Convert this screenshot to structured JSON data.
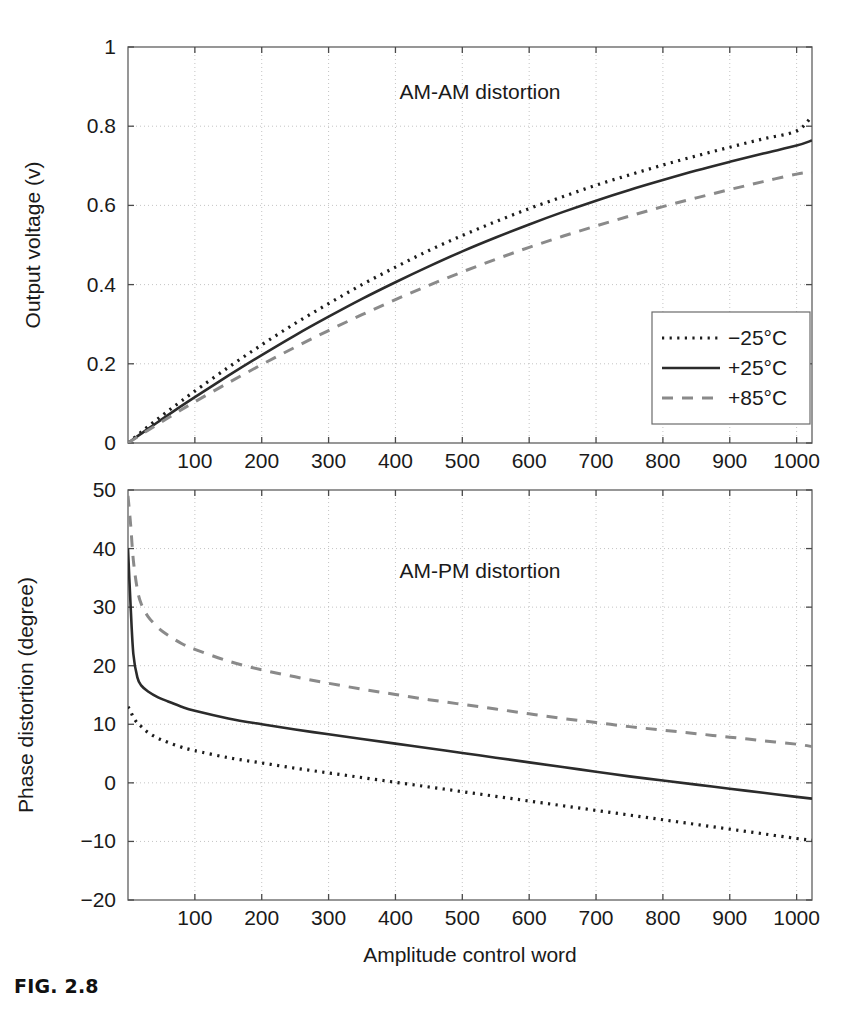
{
  "figure": {
    "caption": "FIG. 2.8"
  },
  "chart_data": [
    {
      "id": "am-am",
      "type": "line",
      "title": "AM-AM distortion",
      "xlabel": "",
      "ylabel": "Output voltage (v)",
      "xlim": [
        0,
        1023
      ],
      "ylim": [
        0,
        1
      ],
      "xticks": [
        100,
        200,
        300,
        400,
        500,
        600,
        700,
        800,
        900,
        1000
      ],
      "xticklabels": [
        "100",
        "200",
        "300",
        "400",
        "500",
        "600",
        "700",
        "800",
        "900",
        "1000"
      ],
      "yticks": [
        0,
        0.2,
        0.4,
        0.6,
        0.8,
        1
      ],
      "yticklabels": [
        "0",
        "0.2",
        "0.4",
        "0.6",
        "0.8",
        "1"
      ],
      "grid": true,
      "legend_position": "lower right",
      "x": [
        0,
        25,
        50,
        75,
        100,
        150,
        200,
        250,
        300,
        350,
        400,
        450,
        500,
        550,
        600,
        650,
        700,
        750,
        800,
        850,
        900,
        950,
        1000,
        1023
      ],
      "series": [
        {
          "name": "-25°C",
          "style": "dotted",
          "color": "#1c1c1c",
          "values": [
            0.0,
            0.035,
            0.068,
            0.1,
            0.131,
            0.191,
            0.248,
            0.302,
            0.352,
            0.4,
            0.444,
            0.486,
            0.524,
            0.559,
            0.592,
            0.622,
            0.651,
            0.677,
            0.702,
            0.725,
            0.747,
            0.768,
            0.788,
            0.826
          ]
        },
        {
          "name": "+25°C",
          "style": "solid",
          "color": "#2b2b2b",
          "values": [
            0.0,
            0.03,
            0.059,
            0.088,
            0.116,
            0.17,
            0.222,
            0.272,
            0.319,
            0.364,
            0.406,
            0.446,
            0.484,
            0.519,
            0.552,
            0.583,
            0.612,
            0.639,
            0.664,
            0.688,
            0.71,
            0.731,
            0.751,
            0.764
          ]
        },
        {
          "name": "+85°C",
          "style": "dashed",
          "color": "#8a8a8a",
          "values": [
            0.0,
            0.027,
            0.053,
            0.079,
            0.104,
            0.152,
            0.198,
            0.242,
            0.284,
            0.324,
            0.362,
            0.398,
            0.432,
            0.464,
            0.494,
            0.522,
            0.548,
            0.573,
            0.597,
            0.619,
            0.64,
            0.66,
            0.679,
            0.684
          ]
        }
      ]
    },
    {
      "id": "am-pm",
      "type": "line",
      "title": "AM-PM distortion",
      "xlabel": "Amplitude control word",
      "ylabel": "Phase distortion (degree)",
      "xlim": [
        0,
        1023
      ],
      "ylim": [
        -20,
        50
      ],
      "xticks": [
        100,
        200,
        300,
        400,
        500,
        600,
        700,
        800,
        900,
        1000
      ],
      "xticklabels": [
        "100",
        "200",
        "300",
        "400",
        "500",
        "600",
        "700",
        "800",
        "900",
        "1000"
      ],
      "yticks": [
        -20,
        -10,
        0,
        10,
        20,
        30,
        40,
        50
      ],
      "yticklabels": [
        "-20",
        "-10",
        "0",
        "10",
        "20",
        "30",
        "40",
        "50"
      ],
      "grid": true,
      "legend_position": "none",
      "x": [
        0,
        4,
        8,
        14,
        20,
        30,
        45,
        60,
        80,
        100,
        150,
        200,
        250,
        300,
        350,
        400,
        450,
        500,
        550,
        600,
        650,
        700,
        750,
        800,
        850,
        900,
        950,
        1000,
        1023
      ],
      "series": [
        {
          "name": "-25°C",
          "style": "dotted",
          "color": "#1c1c1c",
          "values": [
            13.0,
            12.2,
            11.2,
            10.2,
            9.6,
            8.6,
            7.6,
            6.9,
            6.1,
            5.5,
            4.3,
            3.4,
            2.5,
            1.7,
            0.9,
            0.1,
            -0.7,
            -1.5,
            -2.3,
            -3.1,
            -3.9,
            -4.7,
            -5.5,
            -6.3,
            -7.1,
            -7.9,
            -8.7,
            -9.5,
            -9.8
          ]
        },
        {
          "name": "+25°C",
          "style": "solid",
          "color": "#2b2b2b",
          "values": [
            40.0,
            30.0,
            22.0,
            18.0,
            16.6,
            15.6,
            14.6,
            13.9,
            13.0,
            12.3,
            11.0,
            10.0,
            9.1,
            8.3,
            7.5,
            6.7,
            5.9,
            5.1,
            4.3,
            3.5,
            2.7,
            1.9,
            1.1,
            0.4,
            -0.3,
            -1.0,
            -1.7,
            -2.4,
            -2.7
          ]
        },
        {
          "name": "+85°C",
          "style": "dashed",
          "color": "#8a8a8a",
          "values": [
            49.0,
            44.0,
            38.0,
            33.0,
            30.5,
            28.4,
            26.5,
            25.2,
            23.8,
            22.8,
            20.8,
            19.3,
            18.1,
            17.0,
            16.0,
            15.1,
            14.2,
            13.4,
            12.6,
            11.8,
            11.0,
            10.3,
            9.6,
            9.0,
            8.4,
            7.8,
            7.2,
            6.6,
            6.2
          ]
        }
      ]
    }
  ],
  "legend": {
    "entries": [
      {
        "label": "−25°C",
        "style": "dotted",
        "color": "#1c1c1c"
      },
      {
        "label": "+25°C",
        "style": "solid",
        "color": "#2b2b2b"
      },
      {
        "label": "+85°C",
        "style": "dashed",
        "color": "#8a8a8a"
      }
    ]
  }
}
